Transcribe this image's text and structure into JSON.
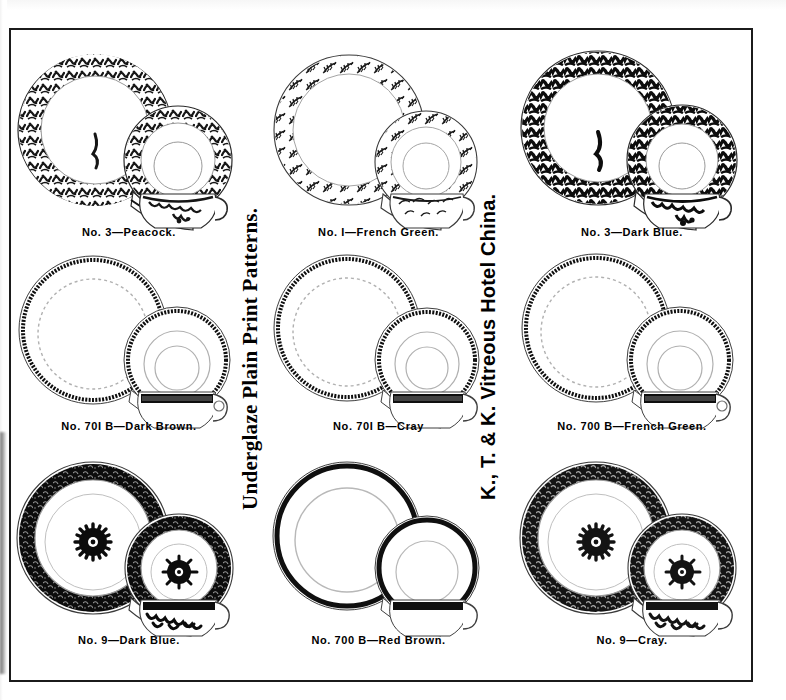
{
  "page": {
    "heading_left": "Underglaze Plain Print Patterns.",
    "heading_right": "K., T. & K. Vitreous Hotel China.",
    "frame_color": "#1b1b1b",
    "ink_color": "#111111",
    "paper_color": "#ffffff"
  },
  "grid": {
    "rows": 3,
    "columns": 3,
    "cells": [
      {
        "id": "cell-r1c1",
        "caption": "No. 3—Peacock.",
        "pattern_no": "No. 3",
        "pattern_name": "Peacock",
        "border_style": "scroll-foliate",
        "density": "medium",
        "has_center_medallion": false,
        "pieces": [
          "plate",
          "saucer",
          "cup"
        ]
      },
      {
        "id": "cell-r1c2",
        "caption": "No. I—French Green.",
        "pattern_no": "No. I",
        "pattern_name": "French Green",
        "border_style": "sprig-fern",
        "density": "light",
        "has_center_medallion": false,
        "pieces": [
          "plate",
          "saucer",
          "cup"
        ]
      },
      {
        "id": "cell-r1c3",
        "caption": "No. 3—Dark Blue.",
        "pattern_no": "No. 3",
        "pattern_name": "Dark Blue",
        "border_style": "scroll-foliate",
        "density": "heavy",
        "has_center_medallion": false,
        "pieces": [
          "plate",
          "saucer",
          "cup"
        ]
      },
      {
        "id": "cell-r2c1",
        "caption": "No. 70I B—Dark Brown.",
        "pattern_no": "No. 70I B",
        "pattern_name": "Dark Brown",
        "border_style": "narrow-band",
        "density": "light",
        "has_center_medallion": false,
        "pieces": [
          "plate",
          "saucer",
          "cup"
        ]
      },
      {
        "id": "cell-r2c2",
        "caption": "No. 70I B—Cray",
        "pattern_no": "No. 70I B",
        "pattern_name": "Cray",
        "border_style": "narrow-band",
        "density": "light",
        "has_center_medallion": false,
        "pieces": [
          "plate",
          "saucer",
          "cup"
        ]
      },
      {
        "id": "cell-r2c3",
        "caption": "No. 700 B—French Green.",
        "pattern_no": "No. 700 B",
        "pattern_name": "French Green",
        "border_style": "narrow-band",
        "density": "light",
        "has_center_medallion": false,
        "pieces": [
          "plate",
          "saucer",
          "cup"
        ]
      },
      {
        "id": "cell-r3c1",
        "caption": "No. 9—Dark Blue.",
        "pattern_no": "No. 9",
        "pattern_name": "Dark Blue",
        "border_style": "broad-leafy-band",
        "density": "heavy",
        "has_center_medallion": true,
        "pieces": [
          "plate",
          "saucer",
          "cup"
        ]
      },
      {
        "id": "cell-r3c2",
        "caption": "No. 700 B—Red Brown.",
        "pattern_no": "No. 700 B",
        "pattern_name": "Red Brown",
        "border_style": "plain-line",
        "density": "light",
        "has_center_medallion": false,
        "pieces": [
          "plate",
          "saucer",
          "cup"
        ]
      },
      {
        "id": "cell-r3c3",
        "caption": "No. 9—Cray.",
        "pattern_no": "No. 9",
        "pattern_name": "Cray",
        "border_style": "broad-leafy-band",
        "density": "heavy",
        "has_center_medallion": true,
        "pieces": [
          "plate",
          "saucer",
          "cup"
        ]
      }
    ]
  }
}
